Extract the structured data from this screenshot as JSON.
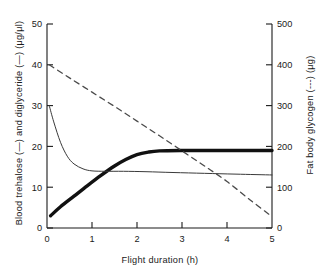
{
  "figure": {
    "background_color": "#ffffff",
    "ink_color": "#1a1a1a"
  },
  "chart_data": {
    "type": "line",
    "title": "",
    "xlabel": "Flight duration (h)",
    "ylabel": "Blood trehalose (—) and diglyceride (—) (μg/μl)",
    "ylabel_right": "Fat body glycogen (---) (μg)",
    "xlim": [
      0,
      5
    ],
    "ylim": [
      0,
      50
    ],
    "ylim_right": [
      0,
      500
    ],
    "xticks": [
      0,
      1,
      2,
      3,
      4,
      5
    ],
    "xticklabels": [
      "0",
      "1",
      "2",
      "3",
      "4",
      "5"
    ],
    "yticks": [
      0,
      10,
      20,
      30,
      40,
      50
    ],
    "yticklabels": [
      "0",
      "10",
      "20",
      "30",
      "40",
      "50"
    ],
    "yticks_right": [
      0,
      100,
      200,
      300,
      400,
      500
    ],
    "yticklabels_right": [
      "0",
      "100",
      "200",
      "300",
      "400",
      "500"
    ],
    "grid": false,
    "legend_position": "none",
    "series": [
      {
        "name": "Blood trehalose",
        "axis": "left",
        "style": "solid-thick",
        "linewidth": 3.4,
        "color": "#111111",
        "x": [
          0.08,
          0.3,
          0.6,
          0.9,
          1.2,
          1.5,
          1.75,
          2.0,
          2.25,
          2.5,
          3.0,
          3.5,
          4.0,
          4.5,
          5.0
        ],
        "y": [
          3.0,
          5.2,
          7.8,
          10.4,
          12.9,
          15.2,
          16.8,
          18.0,
          18.6,
          18.9,
          19.0,
          19.0,
          19.0,
          19.0,
          19.0
        ]
      },
      {
        "name": "Blood diglyceride",
        "axis": "left",
        "style": "solid-thin",
        "linewidth": 1.0,
        "color": "#3a3a3a",
        "x": [
          0.05,
          0.15,
          0.3,
          0.45,
          0.6,
          0.8,
          1.0,
          1.3,
          1.7,
          2.2,
          2.8,
          3.5,
          4.2,
          5.0
        ],
        "y": [
          30.0,
          26.0,
          21.0,
          17.6,
          15.7,
          14.5,
          14.0,
          13.9,
          13.9,
          13.8,
          13.6,
          13.4,
          13.2,
          13.0
        ]
      },
      {
        "name": "Fat body glycogen",
        "axis": "right",
        "style": "dashed",
        "linewidth": 1.3,
        "color": "#4a4a4a",
        "x": [
          0.05,
          0.5,
          1.0,
          1.5,
          2.0,
          2.5,
          3.0,
          3.5,
          4.0,
          4.5,
          5.0
        ],
        "y": [
          400,
          368,
          333,
          298,
          262,
          226,
          189,
          152,
          114,
          70,
          28
        ]
      }
    ]
  }
}
